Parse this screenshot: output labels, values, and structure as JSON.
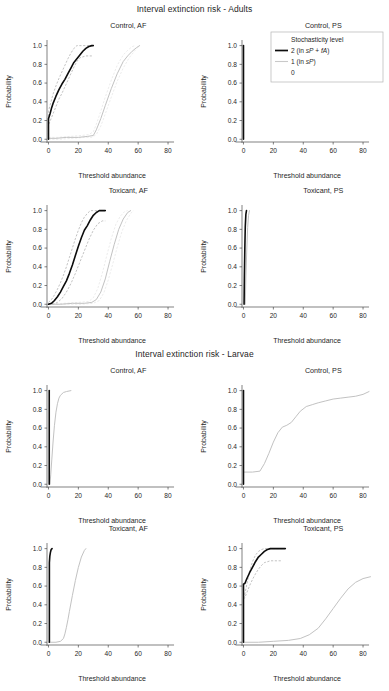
{
  "figure": {
    "width": 389,
    "height": 691,
    "section_titles": {
      "adults": "Interval extinction risk - Adults",
      "larvae": "Interval extinction risk - Larvae"
    }
  },
  "legend": {
    "title": "Stochasticity level",
    "items": [
      {
        "label": "2 (in sP + fA)",
        "key": "dark-line",
        "color": "#0d0d0d"
      },
      {
        "label": "1 (in sP)",
        "key": "light-line",
        "color": "#c9c9c9"
      },
      {
        "label": "0",
        "key": "none",
        "color": "none"
      }
    ]
  },
  "axes": {
    "xlabel": "Threshold abundance",
    "ylabel": "Probability",
    "xlim": [
      -3,
      88
    ],
    "ylim": [
      -0.04,
      1.06
    ],
    "xticks": [
      0,
      20,
      40,
      60,
      80
    ],
    "xtick_labels": [
      "0",
      "20",
      "40",
      "60",
      "80"
    ],
    "yticks": [
      0.0,
      0.2,
      0.4,
      0.6,
      0.8,
      1.0
    ],
    "ytick_labels": [
      "0.0",
      "0.2",
      "0.4",
      "0.6",
      "0.8",
      "1.0"
    ],
    "grid": false
  },
  "chart_data": [
    {
      "id": "adults-control-af",
      "type": "line",
      "title": "Control, AF",
      "group": "Adults",
      "xlabel": "Threshold abundance",
      "ylabel": "Probability",
      "xlim": [
        -3,
        88
      ],
      "ylim": [
        -0.04,
        1.06
      ],
      "series": [
        {
          "name": "2 (in sP + fA)",
          "style": "dark",
          "x": [
            0,
            0,
            1,
            2,
            3,
            5,
            7,
            9,
            11,
            13,
            15,
            17,
            19,
            21,
            23,
            25,
            27,
            29,
            30
          ],
          "values": [
            0.0,
            0.22,
            0.27,
            0.33,
            0.38,
            0.46,
            0.53,
            0.59,
            0.64,
            0.7,
            0.76,
            0.82,
            0.86,
            0.9,
            0.94,
            0.97,
            0.99,
            1.0,
            1.0
          ]
        },
        {
          "name": "2 upper CI",
          "style": "dark-ci",
          "x": [
            0,
            0,
            1,
            3,
            5,
            7,
            9,
            11,
            13,
            15,
            17,
            19,
            21,
            23,
            25,
            27,
            29
          ],
          "values": [
            0.0,
            0.3,
            0.36,
            0.48,
            0.57,
            0.65,
            0.72,
            0.79,
            0.86,
            0.92,
            0.97,
            1.0,
            1.0,
            1.0,
            1.0,
            1.0,
            1.0
          ]
        },
        {
          "name": "2 lower CI",
          "style": "dark-ci",
          "x": [
            0,
            0,
            1,
            3,
            5,
            7,
            9,
            11,
            13,
            15,
            17,
            19,
            21,
            23,
            25,
            27,
            29
          ],
          "values": [
            0.0,
            0.15,
            0.19,
            0.27,
            0.35,
            0.43,
            0.49,
            0.56,
            0.63,
            0.7,
            0.77,
            0.83,
            0.87,
            0.88,
            0.89,
            0.89,
            0.89
          ]
        },
        {
          "name": "1 (in sP)",
          "style": "light",
          "x": [
            0,
            5,
            12,
            20,
            26,
            30,
            32,
            35,
            38,
            42,
            46,
            50,
            53,
            56,
            59,
            61
          ],
          "values": [
            0.01,
            0.01,
            0.02,
            0.02,
            0.03,
            0.04,
            0.1,
            0.22,
            0.36,
            0.54,
            0.7,
            0.83,
            0.89,
            0.94,
            0.98,
            1.0
          ]
        },
        {
          "name": "1 upper CI",
          "style": "light-ci",
          "x": [
            0,
            6,
            14,
            22,
            27,
            30,
            32,
            35,
            38,
            42,
            46,
            50,
            53,
            56,
            58
          ],
          "values": [
            0.02,
            0.02,
            0.03,
            0.04,
            0.05,
            0.08,
            0.16,
            0.3,
            0.45,
            0.63,
            0.79,
            0.9,
            0.95,
            0.99,
            1.0
          ]
        },
        {
          "name": "1 lower CI",
          "style": "light-ci",
          "x": [
            0,
            8,
            16,
            24,
            29,
            32,
            35,
            38,
            42,
            46,
            50,
            54,
            58,
            61
          ],
          "values": [
            0.0,
            0.0,
            0.01,
            0.02,
            0.02,
            0.05,
            0.14,
            0.27,
            0.45,
            0.62,
            0.76,
            0.87,
            0.95,
            1.0
          ]
        }
      ]
    },
    {
      "id": "adults-control-ps",
      "type": "line",
      "title": "Control, PS",
      "group": "Adults",
      "xlabel": "Threshold abundance",
      "ylabel": "Probability",
      "xlim": [
        -3,
        88
      ],
      "ylim": [
        -0.04,
        1.06
      ],
      "series": [
        {
          "name": "2 (in sP + fA)",
          "style": "dark",
          "x": [
            0,
            0
          ],
          "values": [
            0.0,
            1.0
          ]
        }
      ]
    },
    {
      "id": "adults-toxicant-af",
      "type": "line",
      "title": "Toxicant, AF",
      "group": "Adults",
      "xlabel": "Threshold abundance",
      "ylabel": "Probability",
      "xlim": [
        -3,
        88
      ],
      "ylim": [
        -0.04,
        1.06
      ],
      "series": [
        {
          "name": "2 (in sP + fA)",
          "style": "dark",
          "x": [
            0,
            2,
            4,
            6,
            8,
            10,
            12,
            14,
            16,
            18,
            20,
            22,
            24,
            26,
            28,
            30,
            32,
            34,
            36,
            38
          ],
          "values": [
            0.0,
            0.01,
            0.04,
            0.08,
            0.13,
            0.19,
            0.25,
            0.33,
            0.42,
            0.52,
            0.62,
            0.71,
            0.79,
            0.84,
            0.9,
            0.95,
            0.98,
            1.0,
            1.0,
            1.0
          ]
        },
        {
          "name": "2 upper CI",
          "style": "dark-ci",
          "x": [
            0,
            2,
            4,
            6,
            8,
            10,
            12,
            14,
            16,
            18,
            20,
            22,
            24,
            26,
            28,
            30,
            32,
            34
          ],
          "values": [
            0.02,
            0.05,
            0.1,
            0.16,
            0.23,
            0.31,
            0.4,
            0.5,
            0.6,
            0.7,
            0.79,
            0.87,
            0.93,
            0.97,
            1.0,
            1.0,
            1.0,
            1.0
          ]
        },
        {
          "name": "2 lower CI",
          "style": "dark-ci",
          "x": [
            0,
            3,
            6,
            9,
            12,
            15,
            18,
            21,
            24,
            27,
            30,
            33,
            36,
            38
          ],
          "values": [
            0.0,
            0.0,
            0.02,
            0.06,
            0.13,
            0.22,
            0.33,
            0.45,
            0.57,
            0.69,
            0.79,
            0.86,
            0.89,
            0.89
          ]
        },
        {
          "name": "1 (in sP)",
          "style": "light",
          "x": [
            0,
            8,
            16,
            24,
            29,
            32,
            35,
            38,
            41,
            44,
            47,
            50,
            53,
            55
          ],
          "values": [
            0.0,
            0.0,
            0.01,
            0.01,
            0.02,
            0.05,
            0.13,
            0.27,
            0.46,
            0.64,
            0.8,
            0.91,
            0.98,
            1.0
          ]
        },
        {
          "name": "1 upper CI",
          "style": "light-ci",
          "x": [
            0,
            10,
            20,
            27,
            30,
            33,
            36,
            39,
            42,
            45,
            48,
            51,
            53
          ],
          "values": [
            0.0,
            0.01,
            0.02,
            0.03,
            0.07,
            0.17,
            0.33,
            0.52,
            0.7,
            0.85,
            0.94,
            0.99,
            1.0
          ]
        },
        {
          "name": "1 lower CI",
          "style": "light-ci",
          "x": [
            0,
            12,
            22,
            30,
            34,
            37,
            40,
            43,
            46,
            49,
            52,
            55,
            57
          ],
          "values": [
            0.0,
            0.0,
            0.0,
            0.01,
            0.04,
            0.12,
            0.26,
            0.43,
            0.61,
            0.77,
            0.89,
            0.97,
            1.0
          ]
        }
      ]
    },
    {
      "id": "adults-toxicant-ps",
      "type": "line",
      "title": "Toxicant, PS",
      "group": "Adults",
      "xlabel": "Threshold abundance",
      "ylabel": "Probability",
      "xlim": [
        -3,
        88
      ],
      "ylim": [
        -0.04,
        1.06
      ],
      "series": [
        {
          "name": "2 (in sP + fA)",
          "style": "dark",
          "x": [
            0.4,
            0.6,
            0.9,
            1.2,
            1.6,
            2.0
          ],
          "values": [
            0.0,
            0.3,
            0.6,
            0.83,
            0.96,
            1.0
          ]
        },
        {
          "name": "1 (in sP)",
          "style": "light",
          "x": [
            1.2,
            1.6,
            2.2,
            2.8,
            3.4,
            4.0
          ],
          "values": [
            0.0,
            0.28,
            0.58,
            0.82,
            0.95,
            1.0
          ]
        }
      ]
    },
    {
      "id": "larvae-control-af",
      "type": "line",
      "title": "Control, AF",
      "group": "Larvae",
      "xlabel": "Threshold abundance",
      "ylabel": "Probability",
      "xlim": [
        -3,
        88
      ],
      "ylim": [
        -0.04,
        1.06
      ],
      "series": [
        {
          "name": "2 (in sP + fA)",
          "style": "dark",
          "x": [
            0.5,
            0.5
          ],
          "values": [
            0.0,
            1.0
          ]
        },
        {
          "name": "1 (in sP)",
          "style": "light",
          "x": [
            1.0,
            1.5,
            2.2,
            3.0,
            4.0,
            5.0,
            6.0,
            7.0,
            8.0,
            10.0,
            12.0,
            15.0
          ],
          "values": [
            0.0,
            0.1,
            0.26,
            0.44,
            0.63,
            0.77,
            0.86,
            0.92,
            0.95,
            0.98,
            0.99,
            1.0
          ]
        }
      ]
    },
    {
      "id": "larvae-control-ps",
      "type": "line",
      "title": "Control, PS",
      "group": "Larvae",
      "xlabel": "Threshold abundance",
      "ylabel": "Probability",
      "xlim": [
        -3,
        88
      ],
      "ylim": [
        -0.04,
        1.06
      ],
      "series": [
        {
          "name": "2 (in sP + fA)",
          "style": "dark",
          "x": [
            0,
            0
          ],
          "values": [
            0.0,
            1.0
          ]
        },
        {
          "name": "1 (in sP)",
          "style": "light",
          "x": [
            0,
            6,
            11,
            14,
            17,
            20,
            23,
            26,
            29,
            32,
            35,
            38,
            42,
            46,
            50,
            55,
            60,
            65,
            70,
            75,
            80,
            84
          ],
          "values": [
            0.13,
            0.13,
            0.14,
            0.22,
            0.33,
            0.45,
            0.55,
            0.61,
            0.63,
            0.66,
            0.72,
            0.78,
            0.83,
            0.85,
            0.87,
            0.89,
            0.91,
            0.92,
            0.93,
            0.94,
            0.96,
            0.99
          ]
        }
      ]
    },
    {
      "id": "larvae-toxicant-af",
      "type": "line",
      "title": "Toxicant, AF",
      "group": "Larvae",
      "xlabel": "Threshold abundance",
      "ylabel": "Probability",
      "xlim": [
        -3,
        88
      ],
      "ylim": [
        -0.04,
        1.06
      ],
      "series": [
        {
          "name": "2 (in sP + fA)",
          "style": "dark",
          "x": [
            0.6,
            0.6,
            0.9,
            1.3,
            1.8,
            2.4
          ],
          "values": [
            0.0,
            0.85,
            0.92,
            0.96,
            0.99,
            1.0
          ]
        },
        {
          "name": "1 (in sP)",
          "style": "light",
          "x": [
            0,
            5,
            8,
            10,
            11,
            12,
            13,
            14,
            16,
            18,
            20,
            22,
            24,
            25
          ],
          "values": [
            0.0,
            0.0,
            0.01,
            0.04,
            0.09,
            0.16,
            0.24,
            0.33,
            0.5,
            0.66,
            0.8,
            0.91,
            0.98,
            1.0
          ]
        }
      ]
    },
    {
      "id": "larvae-toxicant-ps",
      "type": "line",
      "title": "Toxicant, PS",
      "group": "Larvae",
      "xlabel": "Threshold abundance",
      "ylabel": "Probability",
      "xlim": [
        -3,
        88
      ],
      "ylim": [
        -0.04,
        1.06
      ],
      "series": [
        {
          "name": "2 (in sP + fA)",
          "style": "dark",
          "x": [
            0,
            0,
            1,
            2,
            4,
            6,
            8,
            10,
            12,
            14,
            16,
            18,
            20,
            23,
            26,
            28
          ],
          "values": [
            0.0,
            0.62,
            0.63,
            0.67,
            0.74,
            0.8,
            0.86,
            0.91,
            0.94,
            0.97,
            0.99,
            1.0,
            1.0,
            1.0,
            1.0,
            1.0
          ]
        },
        {
          "name": "2 upper CI",
          "style": "dark-ci",
          "x": [
            0,
            1,
            2,
            4,
            6,
            8,
            10,
            12,
            14,
            16,
            18,
            22,
            26
          ],
          "values": [
            0.47,
            0.52,
            0.6,
            0.75,
            0.86,
            0.93,
            0.97,
            0.99,
            1.0,
            1.0,
            1.0,
            1.0,
            1.0
          ]
        },
        {
          "name": "2 lower CI",
          "style": "dark-ci",
          "x": [
            0,
            1,
            2,
            4,
            6,
            8,
            10,
            12,
            14,
            16,
            18,
            22,
            26
          ],
          "values": [
            0.46,
            0.48,
            0.52,
            0.6,
            0.67,
            0.73,
            0.78,
            0.82,
            0.85,
            0.86,
            0.87,
            0.87,
            0.87
          ]
        },
        {
          "name": "1 (in sP)",
          "style": "light",
          "x": [
            0,
            10,
            20,
            30,
            38,
            44,
            50,
            55,
            60,
            65,
            70,
            75,
            80,
            85
          ],
          "values": [
            0.0,
            0.0,
            0.01,
            0.02,
            0.04,
            0.08,
            0.15,
            0.25,
            0.36,
            0.47,
            0.57,
            0.64,
            0.68,
            0.7
          ]
        }
      ]
    }
  ]
}
